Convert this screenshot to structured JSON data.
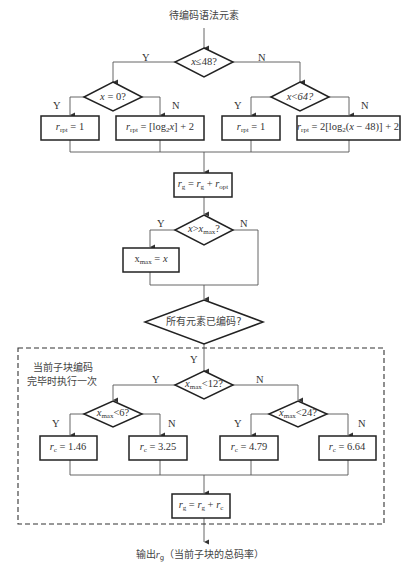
{
  "title": "待编码语法元素",
  "decisions": {
    "d1": {
      "var": "x",
      "op": "≤",
      "val": "48?",
      "yes": "Y",
      "no": "N"
    },
    "d2": {
      "var": "x",
      "op": " = ",
      "val": "0?",
      "yes": "Y",
      "no": "N"
    },
    "d3": {
      "var": "x",
      "op": "<",
      "val": "64?",
      "yes": "Y",
      "no": "N"
    },
    "d4": {
      "var": "x",
      "op": ">",
      "var2": "x",
      "sub2": "max",
      "val": "?",
      "yes": "Y",
      "no": "N"
    },
    "d5": {
      "text": "所有元素已编码?",
      "yes": "Y"
    },
    "d6": {
      "var": "x",
      "sub": "max",
      "op": "<",
      "val": "12?",
      "yes": "Y",
      "no": "N"
    },
    "d7": {
      "var": "x",
      "sub": "max",
      "op": "<",
      "val": "6?",
      "yes": "Y",
      "no": "N"
    },
    "d8": {
      "var": "x",
      "sub": "max",
      "op": "<",
      "val": "24?",
      "yes": "Y",
      "no": "N"
    }
  },
  "boxes": {
    "ropt1": {
      "lhs": "r",
      "lhs_sub": "rpt",
      "rhs": " = 1"
    },
    "ropt2": {
      "lhs": "r",
      "lhs_sub": "rpt",
      "rhs_pre": " = [log",
      "rhs_sub": "2",
      "rhs_var": "x",
      "rhs_post": "] + 2"
    },
    "ropt3": {
      "lhs": "r",
      "lhs_sub": "rpt",
      "rhs": " = 1"
    },
    "ropt4": {
      "lhs": "r",
      "lhs_sub": "rpt",
      "rhs_pre": " = 2[log",
      "rhs_sub": "2",
      "rhs_mid": "(",
      "rhs_var": "x",
      "rhs_post": " − 48)] + 2"
    },
    "rg_opt": {
      "a": "r",
      "a_sub": "g",
      "eq": " = ",
      "b": "r",
      "b_sub": "g",
      "plus": " + ",
      "c": "r",
      "c_sub": "opt"
    },
    "xmax": {
      "lhs": "x",
      "lhs_sub": "max",
      "eq": " = ",
      "rhs": "x"
    },
    "rc1": {
      "lhs": "r",
      "lhs_sub": "c",
      "rhs": " = 1.46"
    },
    "rc2": {
      "lhs": "r",
      "lhs_sub": "c",
      "rhs": " = 3.25"
    },
    "rc3": {
      "lhs": "r",
      "lhs_sub": "c",
      "rhs": " = 4.79"
    },
    "rc4": {
      "lhs": "r",
      "lhs_sub": "c",
      "rhs": " = 6.64"
    },
    "rg_c": {
      "a": "r",
      "a_sub": "g",
      "eq": " = ",
      "b": "r",
      "b_sub": "g",
      "plus": " + ",
      "c": "r",
      "c_sub": "c"
    }
  },
  "note": {
    "line1": "当前子块编码",
    "line2": "完毕时执行一次"
  },
  "output": {
    "pre": "输出",
    "var": "r",
    "sub": "g",
    "post": "（当前子块的总码率）"
  }
}
